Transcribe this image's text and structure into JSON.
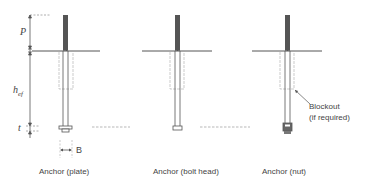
{
  "dimensions": {
    "p": "P",
    "hef_main": "h",
    "hef_sub": "ef",
    "t": "t",
    "b": "B"
  },
  "anchors": [
    {
      "caption": "Anchor (plate)",
      "type": "plate"
    },
    {
      "caption": "Anchor (bolt head)",
      "type": "bolt-head"
    },
    {
      "caption": "Anchor (nut)",
      "type": "nut"
    }
  ],
  "annotation": {
    "line1": "Blockout",
    "line2": "(if required)"
  },
  "colors": {
    "line": "#555555",
    "dark_rod": "#555555",
    "dashed": "#999999"
  }
}
